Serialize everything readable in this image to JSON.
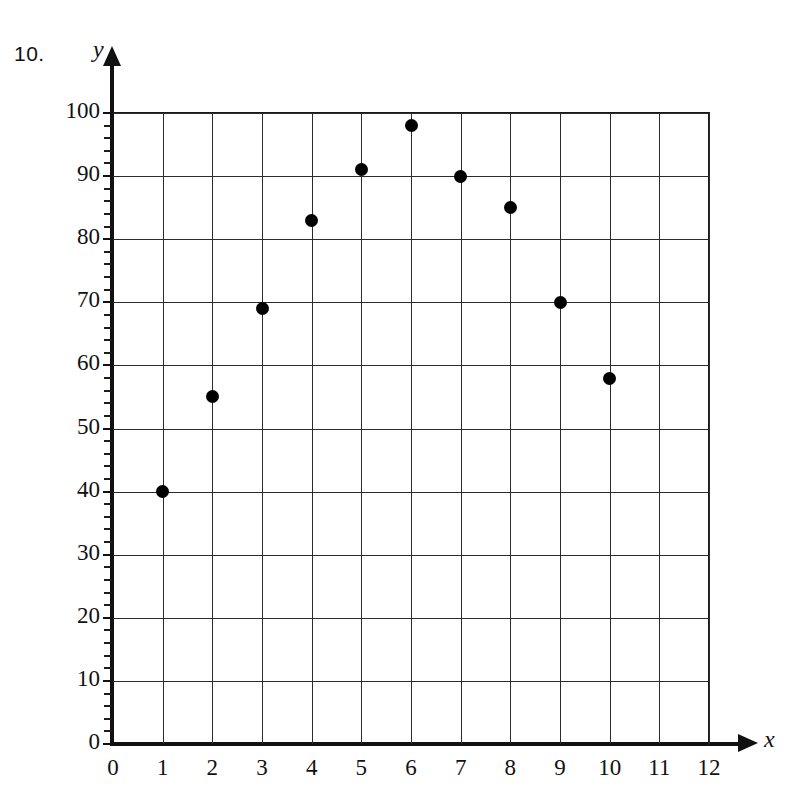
{
  "problem": {
    "number": "10."
  },
  "chart_data": {
    "type": "scatter",
    "title": "",
    "xlabel": "x",
    "ylabel": "y",
    "xlim": [
      0,
      12
    ],
    "ylim": [
      0,
      100
    ],
    "grid": true,
    "legend": false,
    "x_ticks": [
      "0",
      "1",
      "2",
      "3",
      "4",
      "5",
      "6",
      "7",
      "8",
      "9",
      "10",
      "11",
      "12"
    ],
    "y_ticks": [
      "0",
      "10",
      "20",
      "30",
      "40",
      "50",
      "60",
      "70",
      "80",
      "90",
      "100"
    ],
    "y_minor_tick_step": 2,
    "x_tick_step": 1,
    "y_tick_step": 10,
    "x": [
      1,
      2,
      3,
      4,
      5,
      6,
      7,
      8,
      9,
      10
    ],
    "y": [
      40,
      55,
      69,
      83,
      91,
      98,
      90,
      85,
      70,
      58
    ],
    "points": [
      {
        "x": 1,
        "y": 40
      },
      {
        "x": 2,
        "y": 55
      },
      {
        "x": 3,
        "y": 69
      },
      {
        "x": 4,
        "y": 83
      },
      {
        "x": 5,
        "y": 91
      },
      {
        "x": 6,
        "y": 98
      },
      {
        "x": 7,
        "y": 90
      },
      {
        "x": 8,
        "y": 85
      },
      {
        "x": 9,
        "y": 70
      },
      {
        "x": 10,
        "y": 58
      }
    ],
    "marker": {
      "shape": "circle",
      "color": "#000000",
      "size": 13
    },
    "axis_color": "#111111",
    "grid_color": "#2b2b2b",
    "background": "#ffffff"
  }
}
